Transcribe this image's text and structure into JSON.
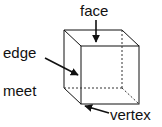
{
  "diagram": {
    "type": "cube-parts",
    "labels": {
      "face": "face",
      "edge": "edge",
      "meet": "meet",
      "vertex": "vertex"
    },
    "colors": {
      "line": "#111111",
      "dashed": "#333333",
      "background": "#ffffff"
    }
  }
}
